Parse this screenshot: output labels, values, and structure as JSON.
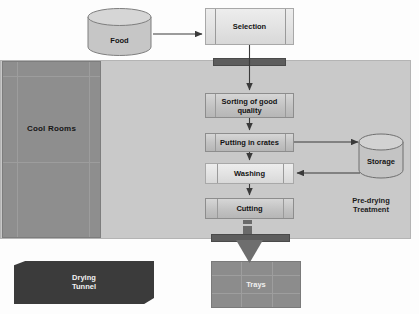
{
  "diagram": {
    "colors": {
      "predrying_zone": "#c9c9c9",
      "cool_rooms": "#8e8e8e",
      "process_box": "#c2c2c2",
      "selection_box": "#e2e2e2",
      "conveyor_bar": "#5d5d5d",
      "drying_tunnel": "#3b3b3b",
      "trays": "#8c8c8c",
      "arrow": "#3a3a3a",
      "text_dark": "#131313",
      "text_light": "#f2f2f2"
    }
  },
  "nodes": {
    "food": {
      "label": "Food",
      "shape": "cylinder"
    },
    "selection": {
      "label": "Selection",
      "shape": "box"
    },
    "sorting": {
      "label": "Sorting of good quality",
      "line1": "Sorting of good",
      "line2": "quality",
      "shape": "box"
    },
    "crates": {
      "label": "Putting in crates",
      "shape": "box"
    },
    "washing": {
      "label": "Washing",
      "shape": "box"
    },
    "cutting": {
      "label": "Cutting",
      "shape": "box"
    },
    "storage": {
      "label": "Storage",
      "shape": "cylinder"
    },
    "trays": {
      "label": "Trays",
      "shape": "grid"
    },
    "drying_tunnel": {
      "label": "Drying Tunnel",
      "line1": "Drying",
      "line2": "Tunnel",
      "shape": "polygon"
    }
  },
  "zones": {
    "cool_rooms": {
      "label": "Cool Rooms"
    },
    "pre_drying": {
      "label": "Pre-drying Treatment",
      "line1": "Pre-drying",
      "line2": "Treatment"
    }
  },
  "edges": [
    {
      "from": "food",
      "to": "selection",
      "direction": "right"
    },
    {
      "from": "selection",
      "to": "sorting",
      "direction": "down"
    },
    {
      "from": "sorting",
      "to": "crates",
      "direction": "down"
    },
    {
      "from": "crates",
      "to": "storage",
      "direction": "right"
    },
    {
      "from": "storage",
      "to": "washing",
      "direction": "left"
    },
    {
      "from": "crates",
      "to": "washing",
      "direction": "down"
    },
    {
      "from": "washing",
      "to": "cutting",
      "direction": "down"
    },
    {
      "from": "cutting",
      "to": "trays",
      "direction": "down"
    }
  ]
}
